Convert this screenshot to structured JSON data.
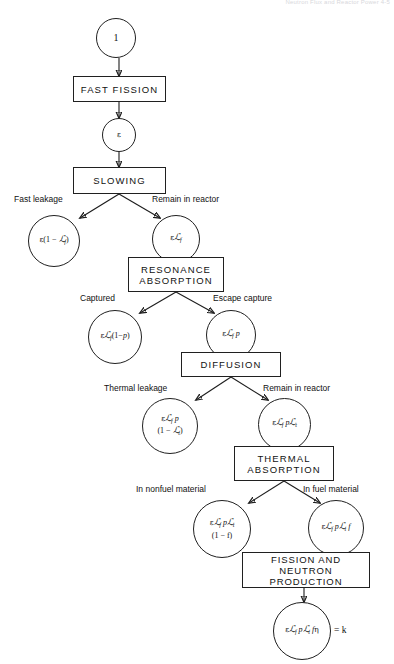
{
  "page": {
    "running_head": "Neutron Flux and Reactor Power     4-5"
  },
  "nodes": {
    "start": {
      "type": "circle",
      "text": "1"
    },
    "fast_fission": {
      "type": "box",
      "lines": [
        "FAST  FISSION"
      ]
    },
    "epsilon": {
      "type": "circle",
      "text": "ε"
    },
    "slowing": {
      "type": "box",
      "lines": [
        "SLOWING"
      ]
    },
    "fast_leak_val": {
      "type": "circle",
      "lines": [
        "ε(1 − ℒf)"
      ]
    },
    "fast_remain_val": {
      "type": "circle",
      "lines": [
        "εℒf"
      ]
    },
    "resonance": {
      "type": "box",
      "lines": [
        "RESONANCE",
        "ABSORPTION"
      ]
    },
    "captured_val": {
      "type": "circle",
      "lines": [
        "εℒf(1−p)"
      ]
    },
    "escape_val": {
      "type": "circle",
      "lines": [
        "εℒf p"
      ]
    },
    "diffusion": {
      "type": "box",
      "lines": [
        "DIFFUSION"
      ]
    },
    "thermal_leak_val": {
      "type": "circle",
      "lines": [
        "εℒf p",
        "(1 − ℒt)"
      ]
    },
    "thermal_rem_val": {
      "type": "circle",
      "lines": [
        "εℒf pℒt"
      ]
    },
    "thermal_abs": {
      "type": "box",
      "lines": [
        "THERMAL",
        "ABSORPTION"
      ]
    },
    "nonfuel_val": {
      "type": "circle",
      "lines": [
        "εℒf pℒt",
        "(1 − f)"
      ]
    },
    "infuel_val": {
      "type": "circle",
      "lines": [
        "εℒf pℒt f"
      ]
    },
    "fission_prod": {
      "type": "box",
      "lines": [
        "FISSION  AND",
        "NEUTRON  PRODUCTION"
      ]
    },
    "k_eff_val": {
      "type": "circle",
      "lines": [
        "εℒf pℒt fη"
      ]
    },
    "k_eff_equals": {
      "type": "text",
      "text": "= k"
    }
  },
  "edge_labels": {
    "fast_leakage": "Fast  leakage",
    "remain_in_reactor1": "Remain in reactor",
    "captured": "Captured",
    "escape_capture": "Escape capture",
    "thermal_leakage": "Thermal leakage",
    "remain_in_reactor2": "Remain in reactor",
    "in_nonfuel": "In nonfuel material",
    "in_fuel": "In fuel material"
  },
  "colors": {
    "stroke": "#1d1d1d",
    "text": "#111111",
    "background": "#ffffff",
    "running_head": "#d8d8dc"
  }
}
